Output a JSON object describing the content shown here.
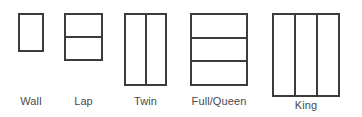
{
  "diagram": {
    "stroke_color": "#3b3b3b",
    "fill_color": "#ffffff",
    "label_color": "#4a4a4a",
    "background_color": "#ffffff",
    "sizes": [
      {
        "label": "Wall",
        "segments": 1,
        "split": "none",
        "x": 18,
        "y": 13,
        "width": 26,
        "height": 39,
        "label_y": 95
      },
      {
        "label": "Lap",
        "segments": 2,
        "split": "horizontal",
        "x": 64,
        "y": 13,
        "width": 39,
        "height": 48,
        "label_y": 95
      },
      {
        "label": "Twin",
        "segments": 2,
        "split": "vertical",
        "x": 124,
        "y": 13,
        "width": 43,
        "height": 73,
        "label_y": 95
      },
      {
        "label": "Full/Queen",
        "segments": 3,
        "split": "horizontal",
        "x": 190,
        "y": 13,
        "width": 58,
        "height": 73,
        "label_y": 95
      },
      {
        "label": "King",
        "segments": 3,
        "split": "vertical",
        "x": 272,
        "y": 13,
        "width": 68,
        "height": 84,
        "label_y": 99
      }
    ]
  }
}
